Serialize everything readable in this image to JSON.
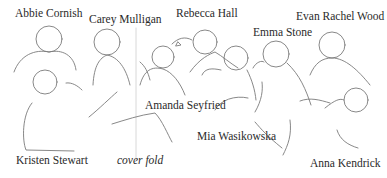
{
  "figure": {
    "colors": {
      "line": "#7a7a7a",
      "text": "#2a2a2a",
      "fold": "#d4d4d4",
      "background": "#ffffff"
    },
    "labels": [
      {
        "id": "abbie-cornish",
        "text": "Abbie Cornish",
        "x": 15,
        "y": 8
      },
      {
        "id": "carey-mulligan",
        "text": "Carey Mulligan",
        "x": 89,
        "y": 14
      },
      {
        "id": "rebecca-hall",
        "text": "Rebecca Hall",
        "x": 176,
        "y": 8
      },
      {
        "id": "emma-stone",
        "text": "Emma Stone",
        "x": 253,
        "y": 27
      },
      {
        "id": "evan-rachel-wood",
        "text": "Evan Rachel Wood",
        "x": 296,
        "y": 11
      },
      {
        "id": "amanda-seyfried",
        "text": "Amanda Seyfried",
        "x": 145,
        "y": 100
      },
      {
        "id": "mia-wasikowska",
        "text": "Mia Wasikowska",
        "x": 197,
        "y": 131
      },
      {
        "id": "kristen-stewart",
        "text": "Kristen Stewart",
        "x": 16,
        "y": 155
      },
      {
        "id": "cover-fold",
        "text": "cover fold",
        "x": 117,
        "y": 155,
        "italic": true
      },
      {
        "id": "anna-kendrick",
        "text": "Anna Kendrick",
        "x": 310,
        "y": 158
      }
    ]
  }
}
